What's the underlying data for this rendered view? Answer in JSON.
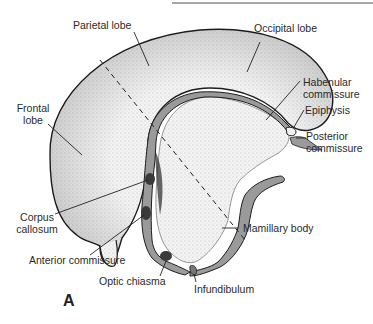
{
  "figure": {
    "panel_letter": "A",
    "colors": {
      "outline": "#1e1e1e",
      "stipple_fill": "#e9e9e9",
      "ventricle_gray": "#9a9a9a",
      "commissure_dark": "#3a3a3a",
      "leader_line": "#222222",
      "label_text": "#2a2a2a"
    }
  },
  "labels": {
    "parietal_lobe": "Parietal lobe",
    "occipital_lobe": "Occipital lobe",
    "frontal_lobe_line1": "Frontal",
    "frontal_lobe_line2": "lobe",
    "habenular_commissure_line1": "Habenular",
    "habenular_commissure_line2": "commissure",
    "epiphysis": "Epiphysis",
    "posterior_commissure_line1": "Posterior",
    "posterior_commissure_line2": "commissure",
    "corpus_callosum_line1": "Corpus",
    "corpus_callosum_line2": "callosum",
    "anterior_commissure": "Anterior commissure",
    "mamillary_body": "Mamillary body",
    "optic_chiasma": "Optic chiasma",
    "infundibulum": "Infundibulum"
  }
}
